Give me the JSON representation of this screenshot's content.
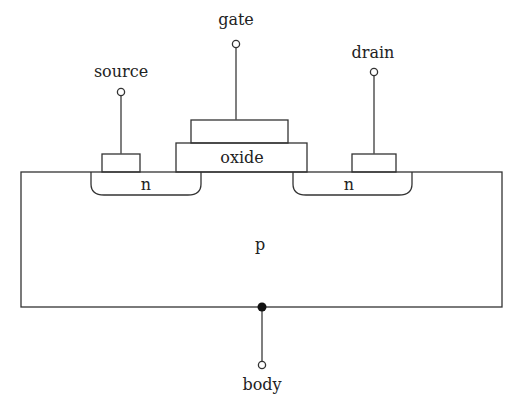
{
  "diagram": {
    "type": "mosfet-cross-section",
    "terminals": {
      "gate": "gate",
      "source": "source",
      "drain": "drain",
      "body": "body"
    },
    "regions": {
      "oxide": "oxide",
      "source_well": "n",
      "drain_well": "n",
      "substrate": "p"
    },
    "colors": {
      "line": "#333333",
      "wire": "#555555",
      "text": "#222222",
      "background": "#ffffff"
    }
  }
}
